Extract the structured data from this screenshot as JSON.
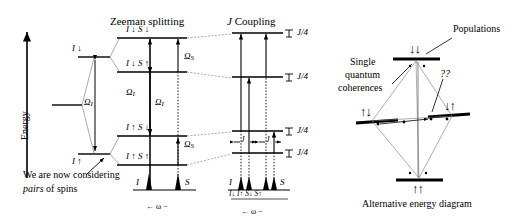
{
  "figure": {
    "caption_left": "Zeeman splitting",
    "caption_mid": "J Coupling",
    "caption_right": "Alternative energy diagram"
  },
  "axis": {
    "energy_label": "Energy"
  },
  "annotation": {
    "line1": "We are now considering",
    "line2_italic": "pairs",
    "line2_rest": " of spins"
  },
  "single_spin": {
    "upper_label": "I ↓",
    "lower_label": "I ↑",
    "splitting_label": "Ω",
    "splitting_sub": "I"
  },
  "zeeman": {
    "levels": [
      {
        "id": "dd",
        "label": "I ↓ S ↓"
      },
      {
        "id": "du",
        "label": "I ↓ S ↑"
      },
      {
        "id": "ud",
        "label": "I ↑ S ↓"
      },
      {
        "id": "uu",
        "label": "I ↑ S ↑"
      }
    ],
    "omega_I_left": "Ω",
    "omega_I_left_sub": "I",
    "omega_I_mid": "Ω",
    "omega_I_mid_sub": "I",
    "omega_S_top": "Ω",
    "omega_S_top_sub": "S",
    "omega_S_bot": "Ω",
    "omega_S_bot_sub": "S"
  },
  "jcoupling": {
    "shift_labels": [
      "J/4",
      "J/4",
      "J/4",
      "J/4"
    ],
    "j_gap_left": "J",
    "j_gap_right": "J"
  },
  "spectrum_zeeman": {
    "peak_I_label": "I",
    "peak_S_label": "S",
    "axis_label": "← ω −"
  },
  "spectrum_jcoupling": {
    "peak_I_label": "I",
    "peak_S_label": "S",
    "sub_labels": "I↓ I↑ S↓ S↑",
    "axis_label": "← ω −"
  },
  "alternative": {
    "populations_label": "Populations",
    "sq_line1": "Single",
    "sq_line2": "quantum",
    "sq_line3": "coherences",
    "unknown_label": "??",
    "states": {
      "top": "↓↓",
      "left": "↑↓",
      "right": "↓↑",
      "bottom": "↑↑"
    }
  }
}
